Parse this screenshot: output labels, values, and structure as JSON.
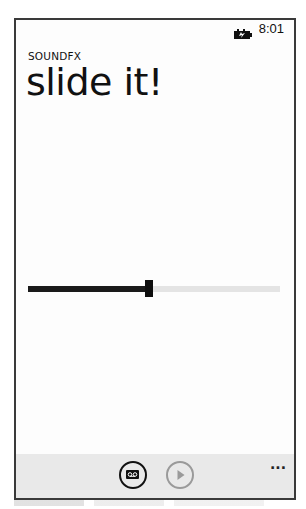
{
  "status_bar": {
    "battery_icon": "battery-charging-icon",
    "time": "8:01"
  },
  "header": {
    "app_title": "SOUNDFX",
    "page_title": "slide it!"
  },
  "slider": {
    "min": 0,
    "max": 100,
    "value": 48,
    "fill_color": "#1a1a1a",
    "track_color": "#e4e4e4"
  },
  "app_bar": {
    "buttons": [
      {
        "icon": "record-icon",
        "label": "record",
        "enabled": true
      },
      {
        "icon": "play-icon",
        "label": "play",
        "enabled": false
      }
    ],
    "more_label": "...",
    "background": "#e9e9e9"
  }
}
